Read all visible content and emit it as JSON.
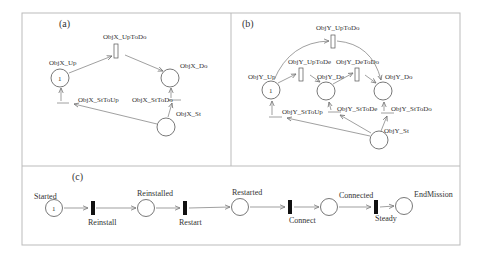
{
  "figure": {
    "panels": {
      "a": {
        "tag": "(a)",
        "places": {
          "up": "ObjX_Up",
          "do": "ObjX_Do",
          "st": "ObjX_St"
        },
        "transitions": {
          "uptodo": "ObjX_UpToDo",
          "sttoup": "ObjX_StToUp",
          "sttodo": "ObjX_StToDo"
        },
        "tokens": {
          "up": "1"
        }
      },
      "b": {
        "tag": "(b)",
        "places": {
          "up": "ObjY_Up",
          "de": "ObjY_De",
          "do": "ObjY_Do",
          "st": "ObjY_St"
        },
        "transitions": {
          "uptodo": "ObjY_UpToDo",
          "uptode": "ObjY_UpToDe",
          "detodo": "ObjY_DeToDo",
          "sttoup": "ObjY_StToUp",
          "sttode": "ObjY_StToDe",
          "sttodo": "ObjY_StToDo"
        },
        "tokens": {
          "up": "1"
        }
      },
      "c": {
        "tag": "(c)",
        "places": {
          "started": "Started",
          "reinstalled": "Reinstalled",
          "restarted": "Restarted",
          "connected": "Connected",
          "endmission": "EndMission"
        },
        "transitions": {
          "reinstall": "Reinstall",
          "restart": "Restart",
          "connect": "Connect",
          "steady": "Steady"
        },
        "tokens": {
          "started": "1"
        }
      }
    }
  }
}
